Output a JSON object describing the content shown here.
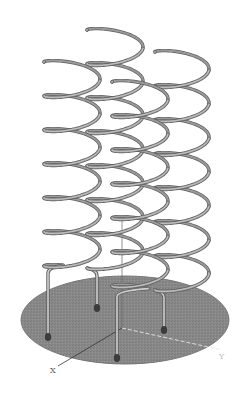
{
  "figure": {
    "title": "",
    "colors": {
      "background": "#ffffff",
      "plate": "#8a8a8a",
      "plate_edge": "#6e6e6e",
      "spring": "#9a9a9a",
      "spring_shadow": "#5e5e5e",
      "spring_highlight": "#cfcfcf",
      "axis": "#3a3a3a",
      "axis_dashed": "#e0e0e0",
      "foot": "#3c3c3c"
    },
    "plate": {
      "cx": 125,
      "cy": 320,
      "rx": 104,
      "ry": 44
    },
    "axes": {
      "x_label": "X",
      "y_label": "Y",
      "origin": [
        122,
        328
      ],
      "x_end": [
        58,
        368
      ],
      "y_end": [
        222,
        350
      ],
      "z_end": [
        122,
        215
      ]
    },
    "springs": [
      {
        "name": "spring-back-left",
        "cx": 72,
        "top": 62,
        "rx": 28,
        "turns": 6.2,
        "pitch": 34,
        "foot": [
          48,
          337
        ]
      },
      {
        "name": "spring-back-center",
        "cx": 115,
        "top": 30,
        "rx": 28,
        "turns": 7,
        "pitch": 34,
        "foot": [
          97,
          308
        ]
      },
      {
        "name": "spring-back-right",
        "cx": 182,
        "top": 52,
        "rx": 27,
        "turns": 7,
        "pitch": 34,
        "foot": [
          164,
          330
        ]
      },
      {
        "name": "spring-front",
        "cx": 140,
        "top": 82,
        "rx": 28,
        "turns": 6.3,
        "pitch": 34,
        "foot": [
          117,
          358
        ]
      }
    ]
  }
}
